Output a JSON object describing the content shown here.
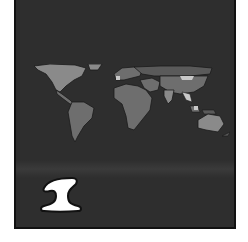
{
  "card": {
    "number": "1",
    "image": "world-map",
    "colors": {
      "background": "#2e2e2e",
      "land_light": "#8a8a8a",
      "land_mid": "#6e6e6e",
      "land_dark": "#5a5a5a",
      "highlight": "#c8c8c8",
      "number_fill": "#ffffff",
      "number_outline": "#111111"
    }
  }
}
